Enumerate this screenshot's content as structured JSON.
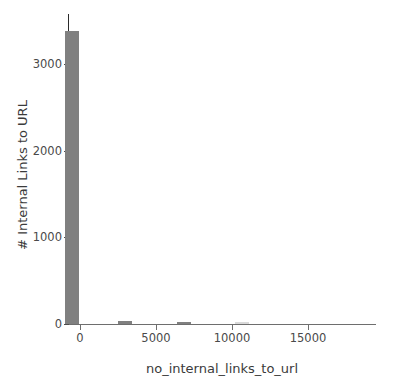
{
  "chart_data": {
    "type": "bar",
    "title": "",
    "subtitle": "",
    "xlabel": "no_internal_links_to_url",
    "ylabel": "# Internal Links to URL",
    "xlim": [
      -250,
      19950
    ],
    "ylim": [
      0,
      3600
    ],
    "xticks": [
      0,
      5000,
      10000,
      15000
    ],
    "xtick_labels": [
      "0",
      "5000",
      "10000",
      "15000"
    ],
    "yticks": [
      0,
      1000,
      2000,
      3000
    ],
    "ytick_labels": [
      "0",
      "1000",
      "2000",
      "3000"
    ],
    "grid": false,
    "legend": null,
    "bar_color": "#808080",
    "bin_width": 900,
    "orientation": "vertical",
    "annotations": [],
    "bars": [
      {
        "x": 0,
        "value": 3400
      },
      {
        "x": 3500,
        "value": 30
      },
      {
        "x": 7400,
        "value": 25
      },
      {
        "x": 11200,
        "value": 3
      }
    ],
    "categories": [
      "0",
      "3500",
      "7400",
      "11200"
    ],
    "values": [
      3400,
      30,
      25,
      3
    ]
  },
  "axes": {
    "ylabel_text": "# Internal Links to URL",
    "xlabel_text": "no_internal_links_to_url"
  },
  "colors": {
    "bar": "#808080",
    "spine": "#2b2b2b",
    "tick_text": "#4a4a4a",
    "background": "#ffffff"
  }
}
